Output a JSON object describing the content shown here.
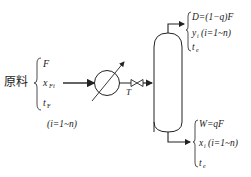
{
  "feed": {
    "label": "原料",
    "vars": [
      "F",
      "x",
      "t"
    ],
    "subs": [
      "",
      "Fi",
      "F"
    ],
    "range": "(i=1~n)"
  },
  "devices": {
    "heater_label": "heat-exchanger",
    "valve_label": "T"
  },
  "top_product": {
    "line1": "D=(1−q)F",
    "line2_var": "y",
    "line2_sub": "i",
    "line2_range": "(i=1~n)",
    "line3_var": "t",
    "line3_sub": "e"
  },
  "bottom_product": {
    "line1": "W=qF",
    "line2_var": "x",
    "line2_sub": "i",
    "line2_range": "(i=1~n)",
    "line3_var": "t",
    "line3_sub": "e"
  },
  "colors": {
    "stroke": "#222222",
    "background": "#ffffff"
  }
}
